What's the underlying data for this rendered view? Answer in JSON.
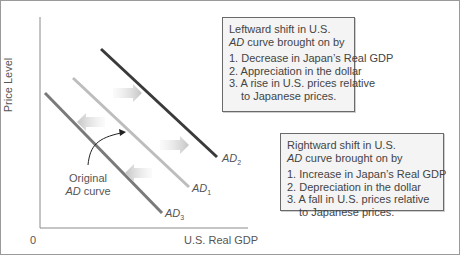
{
  "diagram": {
    "type": "aggregate-demand-shift",
    "axes": {
      "y_label": "Price Level",
      "x_label": "U.S. Real GDP",
      "origin_label": "0"
    },
    "curves": [
      {
        "id": "AD1",
        "label_main": "AD",
        "label_sub": "1",
        "role": "original",
        "color": "#b8b8b8"
      },
      {
        "id": "AD2",
        "label_main": "AD",
        "label_sub": "2",
        "role": "rightward shift",
        "color": "#3a3a3a"
      },
      {
        "id": "AD3",
        "label_main": "AD",
        "label_sub": "3",
        "role": "leftward shift",
        "color": "#7a7a7a"
      }
    ],
    "annotation": {
      "line1": "Original",
      "line2_italic": "AD",
      "line2_rest": " curve"
    },
    "left_box": {
      "line1": "Leftward shift in U.S.",
      "line2_italic": "AD",
      "line2_rest": " curve brought on by",
      "items": [
        "1. Decrease in Japan’s Real GDP",
        "2. Appreciation in the dollar",
        "3. A rise in U.S. prices relative"
      ],
      "item3_cont": "to Japanese prices."
    },
    "right_box": {
      "line1": "Rightward shift in U.S.",
      "line2_italic": "AD",
      "line2_rest": " curve brought on by",
      "items": [
        "1. Increase in Japan’s Real GDP",
        "2. Depreciation in the dollar",
        "3. A fall in U.S. prices relative"
      ],
      "item3_cont": "to Japanese prices."
    }
  }
}
